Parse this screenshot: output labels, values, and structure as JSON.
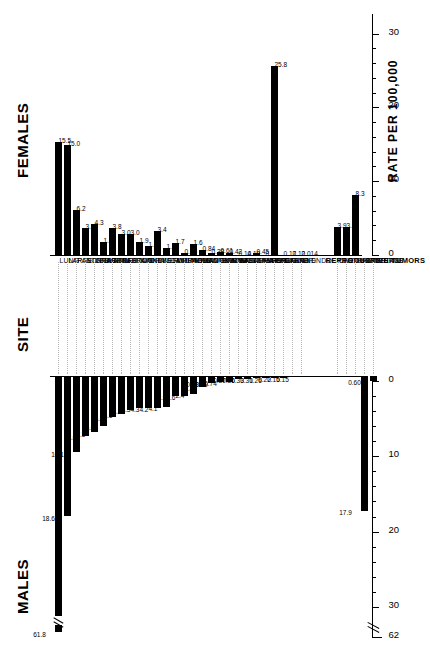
{
  "figure": {
    "males_title": "MALES",
    "site_title": "SITE",
    "females_title": "FEMALES",
    "axis_caption": "RATE PER 100,000",
    "reproductive_group_label": "REPRODUCTIVE TUMORS"
  },
  "chart_data": {
    "type": "bar",
    "title": "",
    "subtitle": "",
    "orientation": "back-to-back horizontal bars (population-pyramid style)",
    "xlabel": "RATE PER 100,000",
    "ylabel": "SITE",
    "grid": false,
    "legend": [],
    "axis": {
      "males": {
        "ticks_major": [
          0,
          10,
          20,
          30,
          62
        ],
        "tick_labels": [
          "0",
          "10",
          "20",
          "30",
          "62"
        ],
        "minor_tick_step": 2,
        "xlim": [
          0,
          34
        ],
        "direction": "right-to-left",
        "has_break": true,
        "break_between": [
          30,
          62
        ]
      },
      "females": {
        "ticks_major": [
          0,
          10,
          20,
          30
        ],
        "tick_labels": [
          "0",
          "10",
          "20",
          "30"
        ],
        "minor_tick_step": 2,
        "xlim": [
          0,
          32
        ],
        "direction": "left-to-right",
        "has_break": false
      }
    },
    "categories": [
      "LUNG",
      "LARGE INTESTINE",
      "PANCREAS",
      "STOMACH",
      "LEUKEMIA",
      "BLADDER",
      "NON-HODGKIN'S LYMPHOMA",
      "RECTUM",
      "BRAIN",
      "KIDNEY",
      "ORAL CAVITY",
      "LIVER",
      "ESOPHAGUS",
      "MULTIPLE MYELOMA",
      "LARYNX",
      "MELANOMA",
      "HODGKIN'S DISEASE",
      "OTHER SKIN",
      "CONNECTIVE TISSUE",
      "BONE",
      "NASOPHARYNX",
      "SALIVARY GLAND",
      "THYROID GLAND",
      "NOSE",
      "BREAST",
      "OTHER ENDOCRINE",
      "EYE",
      "LIP"
    ],
    "series": [
      {
        "name": "MALES",
        "values": [
          61.8,
          18.6,
          10.1,
          8.0,
          7.5,
          6.6,
          5.5,
          5.1,
          4.5,
          4.3,
          4.3,
          4.2,
          4.1,
          2.6,
          2.6,
          2.4,
          1.4,
          0.88,
          0.79,
          0.74,
          0.37,
          0.36,
          0.33,
          0.31,
          0.26,
          0.22,
          0.15,
          0.15
        ],
        "labels": [
          "61.8",
          "18.6",
          "10.1",
          "8.0",
          "7.5",
          "6.6",
          "5.5",
          "5.1",
          "4.5",
          "4.3",
          "4.3",
          "4.2",
          "4.1",
          "2.6",
          "2.6",
          "2.4",
          "1.4",
          "0.88",
          "0.79",
          "0.74",
          "0.37",
          "0.36",
          "0.33",
          "0.31",
          "0.26",
          "0.22",
          "0.15",
          "0.15"
        ]
      },
      {
        "name": "FEMALES",
        "values": [
          15.5,
          15.0,
          6.2,
          3.8,
          4.3,
          1.9,
          3.8,
          3.0,
          3.0,
          1.9,
          1.4,
          3.4,
          1.1,
          1.7,
          0.35,
          1.6,
          0.84,
          0.38,
          0.61,
          0.42,
          0.14,
          0.18,
          0.45,
          0.15,
          25.8,
          0.17,
          0.12,
          0.014
        ],
        "labels": [
          "15.5",
          "15.0",
          "6.2",
          "3.8",
          "4.3",
          "1.9",
          "3.8",
          "3.0",
          "3.0",
          "1.9",
          "1.4",
          "3.4",
          "1.1",
          "1.7",
          "0.35",
          "1.6",
          "0.84",
          "0.38",
          "0.61",
          "0.42",
          "0.14",
          "0.18",
          "0.45",
          "0.15",
          "25.8",
          "0.17",
          "0.12",
          "0.014"
        ]
      }
    ],
    "reproductive": {
      "group_label": "REPRODUCTIVE TUMORS",
      "categories": [
        "CERVIX UTERI",
        "OTHER UTERUS",
        "OVARY",
        "PROSTATE",
        "TESTIS"
      ],
      "males": [
        null,
        null,
        null,
        17.9,
        0.6
      ],
      "males_labels": [
        "",
        "",
        "",
        "17.9",
        "0.60"
      ],
      "females": [
        3.9,
        3.9,
        8.3,
        null,
        null
      ],
      "females_labels": [
        "3.9",
        "3.9",
        "8.3",
        "",
        ""
      ]
    }
  }
}
